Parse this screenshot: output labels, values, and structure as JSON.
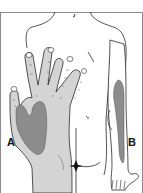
{
  "figure": {
    "type": "anatomical-illustration",
    "labels": {
      "a": "A",
      "b": "B"
    },
    "colors": {
      "background": "#ffffff",
      "frame": "#8a8a8a",
      "outline": "#2a2a2a",
      "hand_fill": "#d4d4d4",
      "shaded_region": "#8c8c8c",
      "skin": "#ffffff"
    },
    "regions": [
      {
        "id": "A",
        "location": "palm / thenar area of the hand"
      },
      {
        "id": "B",
        "location": "ventral forearm"
      }
    ]
  }
}
